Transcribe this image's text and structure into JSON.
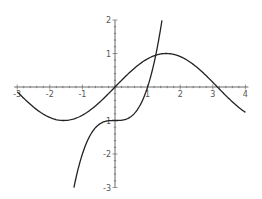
{
  "chart_data": {
    "type": "line",
    "title": "",
    "xlabel": "",
    "ylabel": "",
    "xlim": [
      -3,
      4
    ],
    "ylim": [
      -3,
      2
    ],
    "grid": false,
    "x_ticks": [
      -3,
      -2,
      -1,
      1,
      2,
      3,
      4
    ],
    "x_tick_labels": [
      "-3",
      "-2",
      "-1",
      "1",
      "2",
      "3",
      "4"
    ],
    "y_ticks": [
      -3,
      -2,
      -1,
      1,
      2
    ],
    "y_tick_labels": [
      "-3",
      "-2",
      "-1",
      "1",
      "2"
    ],
    "series": [
      {
        "name": "sin(x)",
        "x": [
          -3,
          -2.5,
          -2,
          -1.5708,
          -1,
          -0.5,
          0,
          0.5,
          1,
          1.5708,
          2,
          2.5,
          3,
          3.5,
          4
        ],
        "values": [
          -0.141,
          -0.598,
          -0.909,
          -1.0,
          -0.841,
          -0.479,
          0,
          0.479,
          0.841,
          1.0,
          0.909,
          0.598,
          0.141,
          -0.351,
          -0.757
        ]
      },
      {
        "name": "x^3 - 1",
        "x": [
          -1.26,
          -1,
          -0.75,
          -0.5,
          -0.25,
          0,
          0.25,
          0.5,
          0.75,
          1,
          1.2,
          1.3,
          1.44
        ],
        "values": [
          -3.0,
          -2.0,
          -1.422,
          -1.125,
          -1.016,
          -1.0,
          -0.984,
          -0.875,
          -0.578,
          0,
          0.728,
          1.197,
          1.986
        ]
      }
    ]
  }
}
